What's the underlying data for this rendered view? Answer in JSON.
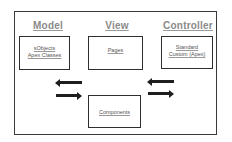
{
  "diagram": {
    "model": {
      "title": "Model",
      "items": [
        "sObjects",
        "Apex Classes"
      ]
    },
    "view": {
      "title": "View",
      "items": [
        "Pages"
      ]
    },
    "controller": {
      "title": "Controller",
      "items": [
        "Standard",
        "Custom (Apex)"
      ]
    },
    "components": {
      "items": [
        "Components"
      ]
    },
    "arrows": [
      {
        "name": "model-left-arrow",
        "direction": "left"
      },
      {
        "name": "model-right-arrow",
        "direction": "right"
      },
      {
        "name": "controller-left-arrow",
        "direction": "left"
      },
      {
        "name": "controller-right-arrow",
        "direction": "right"
      }
    ],
    "colors": {
      "frame": "#3a3a3a",
      "title": "#8a8a8a",
      "box_border": "#2e2e2e",
      "arrow": "#1e1e1e",
      "text": "#555555"
    }
  }
}
